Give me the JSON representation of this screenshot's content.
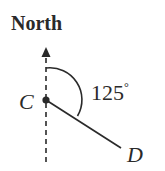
{
  "diagram": {
    "title_label": "North",
    "point_c_label": "C",
    "point_d_label": "D",
    "angle_label": "125",
    "angle_unit": "°",
    "bearing_degrees": 125,
    "colors": {
      "ink": "#2a2a2a",
      "background": "#ffffff"
    }
  }
}
